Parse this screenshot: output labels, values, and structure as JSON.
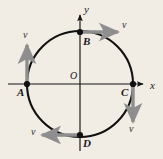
{
  "figure": {
    "name": "circular-motion-velocity-vectors",
    "background_color": "#f1ece4",
    "axes": {
      "x_label": "x",
      "y_label": "y",
      "origin_label": "O",
      "axis_color": "#141414"
    },
    "circle": {
      "center": [
        80,
        84
      ],
      "radius": 53,
      "stroke_color": "#111111",
      "stroke_width": 2.1,
      "fill": "none"
    },
    "points": [
      {
        "id": "A",
        "label": "A",
        "x": 27,
        "y": 84,
        "label_dx": -10,
        "label_dy": 5
      },
      {
        "id": "B",
        "label": "B",
        "x": 80,
        "y": 32,
        "label_dx": 3,
        "label_dy": 5
      },
      {
        "id": "C",
        "label": "C",
        "x": 133,
        "y": 84,
        "label_dx": -12,
        "label_dy": 5
      },
      {
        "id": "D",
        "label": "D",
        "x": 80,
        "y": 135,
        "label_dx": 3,
        "label_dy": 5
      }
    ],
    "vectors": [
      {
        "at_point": "A",
        "label": "v",
        "direction": "up",
        "color": "#8e8e8e",
        "label_x": 23,
        "label_y": 34
      },
      {
        "at_point": "B",
        "label": "v",
        "direction": "right",
        "color": "#8e8e8e",
        "label_x": 122,
        "label_y": 24
      },
      {
        "at_point": "C",
        "label": "v",
        "direction": "down",
        "color": "#8e8e8e",
        "label_x": 129,
        "label_y": 128
      },
      {
        "at_point": "D",
        "label": "v",
        "direction": "left",
        "color": "#8e8e8e",
        "label_x": 32,
        "label_y": 128
      }
    ]
  }
}
